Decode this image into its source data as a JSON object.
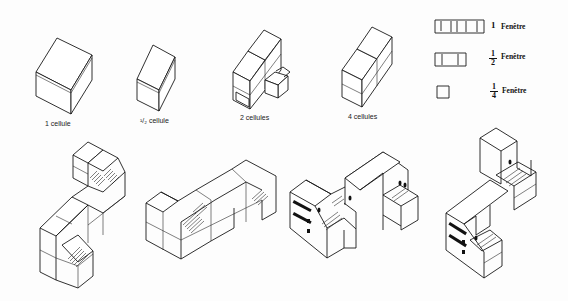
{
  "top_row": {
    "labels": {
      "one_cell": "1 cellule",
      "half_cell": "¹/₂ cellule",
      "two_cells": "2 cellules",
      "four_cells": "4 cellules"
    }
  },
  "legend": {
    "items": [
      {
        "numerator": "1",
        "denominator": "",
        "label": "Fenêtre",
        "panes": 5
      },
      {
        "numerator": "1",
        "denominator": "2",
        "label": "Fenêtre",
        "panes": 3
      },
      {
        "numerator": "1",
        "denominator": "4",
        "label": "Fenêtre",
        "panes": 1
      }
    ]
  },
  "bottom_row": {
    "assemblies": [
      {
        "name": "wireframe-s-assembly"
      },
      {
        "name": "wireframe-z-assembly"
      },
      {
        "name": "rendered-z-building"
      },
      {
        "name": "rendered-s-building"
      }
    ]
  },
  "colors": {
    "ink": "#1a1a1a",
    "paper": "#fdfdfd"
  }
}
